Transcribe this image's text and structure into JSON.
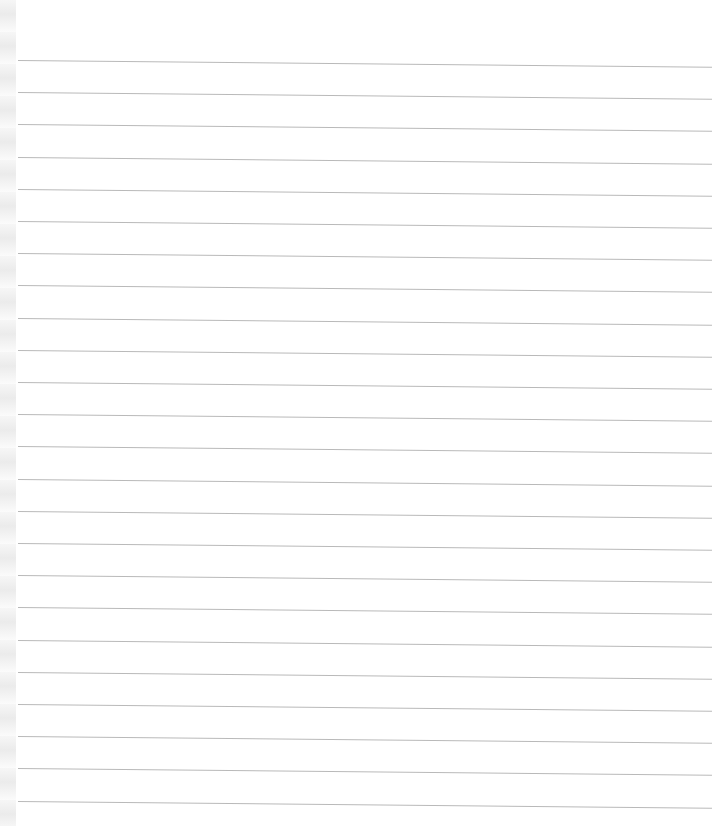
{
  "page": {
    "type": "blank lined notebook page",
    "background_color": "#ffffff",
    "rule_color": "#b9b9b9",
    "rule_count": 24,
    "first_rule_y": 60,
    "rule_spacing": 32.2,
    "rule_left_x": 18,
    "rule_right_x": 712
  }
}
